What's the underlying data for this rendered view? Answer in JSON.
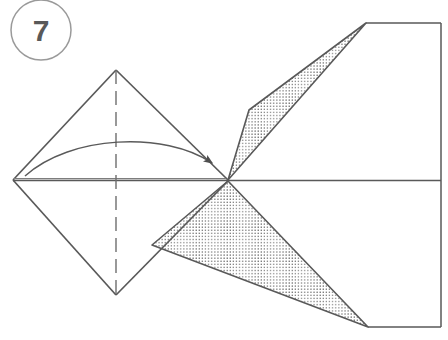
{
  "figure": {
    "kind": "origami-fold-diagram",
    "step_badge": {
      "label": "7",
      "shape": "circle",
      "cx": 41,
      "cy": 30,
      "r": 30,
      "stroke": "#9a9a9a",
      "text_color": "#595959"
    },
    "canvas": {
      "width": 448,
      "height": 340,
      "background": "#ffffff"
    },
    "colors": {
      "line": "#595959",
      "line_light": "#8c8c8c",
      "stipple_dot": "#4a4a4a",
      "stipple_background": "#ffffff",
      "arrow_fill": "#4f4f4f",
      "badge_stroke": "#9a9a9a"
    },
    "geometry": {
      "center_line": {
        "x1": 13,
        "y1": 180,
        "x2": 441,
        "y2": 180
      },
      "left_vertex": {
        "x": 13,
        "y": 180
      },
      "top_vertex": {
        "x": 116,
        "y": 70
      },
      "bottom_vertex": {
        "x": 116,
        "y": 295
      },
      "center_point": {
        "x": 228,
        "y": 180
      },
      "upper_triangle_apex": {
        "x": 366,
        "y": 23
      },
      "lower_triangle_apex": {
        "x": 368,
        "y": 327
      },
      "frame_right_x": 441,
      "frame_top_y": 23,
      "frame_bottom_y": 327,
      "dashed_line_x": 116,
      "dash_pattern": "14 7"
    },
    "elements": [
      {
        "name": "diamond-outline",
        "type": "polygon",
        "fill": "none",
        "note": "left square rotated 45 degrees"
      },
      {
        "name": "vertical-valley-crease",
        "type": "dashed-line",
        "note": "vertical dashed crease through diamond"
      },
      {
        "name": "horizontal-center-line",
        "type": "solid-line",
        "note": "central horizontal fold/edge line"
      },
      {
        "name": "upper-stippled-triangle",
        "type": "polygon",
        "fill": "stipple",
        "note": "shaded reverse side of paper, upper right"
      },
      {
        "name": "lower-stippled-triangle",
        "type": "polygon",
        "fill": "stipple",
        "note": "shaded reverse side of paper, lower right"
      },
      {
        "name": "fold-arrow",
        "type": "curved-arrow",
        "note": "arc from left vertex curving right to center point"
      },
      {
        "name": "frame-lines",
        "type": "polyline",
        "note": "right-hand paper edges forming open rectangle"
      }
    ]
  }
}
